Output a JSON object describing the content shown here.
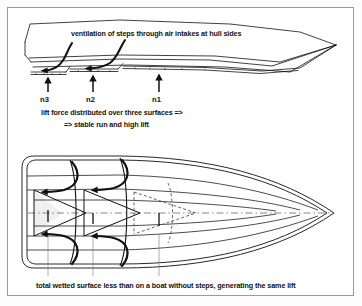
{
  "figure": {
    "captions": {
      "top": "ventilation of steps through air intakes at hull sides",
      "middle_line1": "lift force distributed over three surfaces =>",
      "middle_line2": "=> stable run and high lift",
      "bottom": "total wetted surface less than on a boat without steps, generating the same lift"
    },
    "step_labels": [
      {
        "id": "n3",
        "text": "n3"
      },
      {
        "id": "n2",
        "text": "n2"
      },
      {
        "id": "n1",
        "text": "n1"
      }
    ],
    "views": [
      {
        "name": "profile-view",
        "description": "side elevation of stepped planing hull, bow to the right"
      },
      {
        "name": "plan-view",
        "description": "bottom plan of hull showing three triangular wetted surfaces"
      }
    ],
    "colors": {
      "line": "#111111",
      "border": "#9a9a9a",
      "background": "#ffffff",
      "shade": "#efefef",
      "dashed": "#555555"
    }
  }
}
